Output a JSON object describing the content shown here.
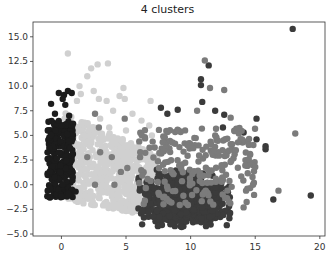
{
  "chart_data": {
    "type": "scatter",
    "title": "4 clusters",
    "xlabel": "",
    "ylabel": "",
    "xlim": [
      -2.2,
      20.4
    ],
    "ylim": [
      -5.2,
      16.5
    ],
    "xticks": [
      0,
      5,
      10,
      15,
      20
    ],
    "xtick_labels": [
      "0",
      "5",
      "10",
      "15",
      "20"
    ],
    "yticks": [
      15.0,
      12.5,
      10.0,
      7.5,
      5.0,
      2.5,
      0.0,
      -2.5,
      -5.0
    ],
    "ytick_labels": [
      "15.0",
      "12.5",
      "10.0",
      "7.5",
      "5.0",
      "2.5",
      "0.0",
      "−2.5",
      "−5.0"
    ],
    "grid": false,
    "legend": null,
    "series": [
      {
        "name": "cluster 0",
        "color": "#d0d0d0",
        "description": "light gray wedge",
        "region": {
          "x": [
            0,
            7.5
          ],
          "y": [
            -3.2,
            8
          ]
        },
        "count": 700,
        "points": [
          [
            0.5,
            13.3
          ],
          [
            2.3,
            11.8
          ],
          [
            3.6,
            12.3
          ],
          [
            2.0,
            11.0
          ],
          [
            2.8,
            12.2
          ],
          [
            1.4,
            10.0
          ],
          [
            2.5,
            9.5
          ],
          [
            4.8,
            9.8
          ],
          [
            4.5,
            9.0
          ],
          [
            4.9,
            8.7
          ],
          [
            3.5,
            8.5
          ],
          [
            1.2,
            8.5
          ],
          [
            2.9,
            8.7
          ],
          [
            6.9,
            8.5
          ],
          [
            4.0,
            7.5
          ],
          [
            5.5,
            7.2
          ],
          [
            3.0,
            6.7
          ],
          [
            1.8,
            6.3
          ],
          [
            6.2,
            6.5
          ],
          [
            6.8,
            6.0
          ],
          [
            5.0,
            5.5
          ],
          [
            3.7,
            5.8
          ],
          [
            7.0,
            5.0
          ],
          [
            1.5,
            9.2
          ]
        ]
      },
      {
        "name": "cluster 1",
        "color": "#1c1c1c",
        "description": "near-black column",
        "region": {
          "x": [
            -1.3,
            1.0
          ],
          "y": [
            -1.4,
            6.5
          ]
        },
        "count": 260,
        "points": [
          [
            -0.2,
            9.3
          ],
          [
            0.5,
            9.5
          ],
          [
            0.2,
            9.1
          ],
          [
            -0.8,
            8.2
          ],
          [
            0.3,
            8.1
          ],
          [
            -0.5,
            7.2
          ],
          [
            0.6,
            7.0
          ],
          [
            0.9,
            6.2
          ],
          [
            1.1,
            -0.7
          ],
          [
            0.1,
            8.7
          ],
          [
            0.8,
            9.3
          ]
        ]
      },
      {
        "name": "cluster 2",
        "color": "#3b3b3b",
        "description": "dark gray dense blob",
        "region": {
          "x": [
            5.5,
            14.8
          ],
          "y": [
            -4.2,
            6.5
          ]
        },
        "count": 900,
        "points": [
          [
            17.9,
            15.8
          ],
          [
            11.4,
            12.1
          ],
          [
            10.8,
            10.7
          ],
          [
            10.8,
            10.1
          ],
          [
            10.9,
            8.4
          ],
          [
            11.9,
            7.5
          ],
          [
            12.6,
            7.1
          ],
          [
            12.5,
            5.8
          ],
          [
            15.1,
            6.7
          ],
          [
            15.1,
            4.6
          ],
          [
            15.8,
            3.6
          ],
          [
            15.8,
            3.9
          ],
          [
            14.1,
            5.3
          ],
          [
            9.0,
            7.6
          ],
          [
            7.7,
            7.8
          ],
          [
            8.2,
            7.2
          ],
          [
            16.4,
            -1.5
          ],
          [
            19.3,
            -1.1
          ],
          [
            9.3,
            -4.3
          ],
          [
            12.8,
            -4.1
          ],
          [
            13.0,
            -3.4
          ]
        ]
      },
      {
        "name": "cluster 3",
        "color": "#7b7b7b",
        "description": "mid gray scattered",
        "region": {
          "x": [
            2.0,
            15.5
          ],
          "y": [
            -2.5,
            7.0
          ]
        },
        "count": 220,
        "points": [
          [
            11.1,
            12.6
          ],
          [
            11.5,
            9.8
          ],
          [
            12.6,
            9.6
          ],
          [
            10.5,
            7.5
          ],
          [
            13.1,
            6.8
          ],
          [
            18.1,
            5.2
          ],
          [
            16.8,
            -0.6
          ],
          [
            14.5,
            2.6
          ],
          [
            15.0,
            1.8
          ],
          [
            14.1,
            -2.3
          ],
          [
            4.9,
            6.7
          ],
          [
            2.6,
            7.2
          ],
          [
            2.9,
            5.8
          ],
          [
            2.0,
            2.8
          ],
          [
            2.6,
            0.0
          ],
          [
            4.1,
            0.0
          ],
          [
            3.0,
            3.3
          ],
          [
            3.9,
            2.8
          ],
          [
            4.6,
            1.3
          ],
          [
            5.1,
            1.7
          ],
          [
            6.1,
            3.3
          ],
          [
            13.5,
            3.5
          ],
          [
            12.0,
            4.8
          ]
        ]
      }
    ]
  }
}
